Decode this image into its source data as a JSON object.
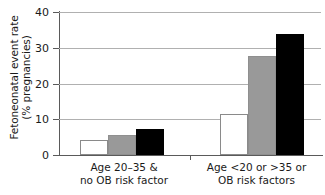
{
  "chart_data": {
    "type": "bar",
    "title": "",
    "subtitle": "",
    "xlabel": "",
    "ylabel": "Fetoneonatal event rate\n(% pregnancies)",
    "ylabel_line1": "Fetoneonatal event rate",
    "ylabel_line2": "(% pregnancies)",
    "ylim": [
      0,
      40
    ],
    "ytick_values": [
      0,
      10,
      20,
      30,
      40
    ],
    "ytick_labels": [
      "0",
      "10",
      "20",
      "30",
      "40"
    ],
    "grid": "horizontal",
    "legend": "none",
    "categories": [
      "Age 20–35 &\nno OB risk factor",
      "Age <20 or >35 or\nOB risk factors"
    ],
    "category_labels": [
      {
        "line1": "Age 20–35 &",
        "line2": "no OB risk factor"
      },
      {
        "line1": "Age <20 or >35 or",
        "line2": "OB risk factors"
      }
    ],
    "series": [
      {
        "name": "series-1",
        "color": "#ffffff",
        "values": [
          4.3,
          11.5
        ]
      },
      {
        "name": "series-2",
        "color": "#999999",
        "values": [
          5.5,
          27.8
        ]
      },
      {
        "name": "series-3",
        "color": "#000000",
        "values": [
          7.3,
          33.8
        ]
      }
    ],
    "colors": {
      "series_white": "#ffffff",
      "series_gray": "#999999",
      "series_black": "#000000",
      "gridline": "#b0b0b0",
      "axis": "#5a5a5a",
      "text": "#1a1a1a",
      "background": "#ffffff"
    }
  }
}
